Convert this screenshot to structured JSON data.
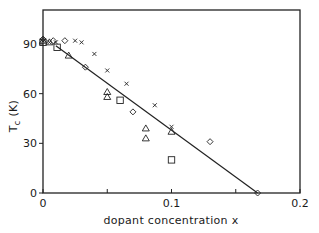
{
  "chart_data": {
    "type": "scatter",
    "title": "",
    "xlabel": "dopant concentration x",
    "ylabel": "T_c (K)",
    "ylabel_main": "T",
    "ylabel_sub": "c",
    "ylabel_unit": "(K)",
    "xlim": [
      0,
      0.2
    ],
    "ylim": [
      0,
      100
    ],
    "grid": false,
    "legend": "none",
    "x_ticks": [
      0,
      0.05,
      0.1,
      0.15,
      0.2
    ],
    "x_tick_labels": [
      "0",
      "",
      "0.1",
      "",
      "0.2"
    ],
    "y_ticks": [
      0,
      30,
      60,
      90
    ],
    "y_tick_labels": [
      "0",
      "30",
      "60",
      "90"
    ],
    "series": [
      {
        "name": "cross",
        "marker": "x",
        "points": [
          {
            "x": 0.0,
            "y": 92
          },
          {
            "x": 0.005,
            "y": 91
          },
          {
            "x": 0.01,
            "y": 91
          },
          {
            "x": 0.025,
            "y": 92
          },
          {
            "x": 0.03,
            "y": 91
          },
          {
            "x": 0.04,
            "y": 84
          },
          {
            "x": 0.05,
            "y": 74
          },
          {
            "x": 0.065,
            "y": 66
          },
          {
            "x": 0.087,
            "y": 53
          },
          {
            "x": 0.1,
            "y": 40
          }
        ]
      },
      {
        "name": "triangle",
        "marker": "triangle",
        "points": [
          {
            "x": 0.0,
            "y": 92
          },
          {
            "x": 0.005,
            "y": 91
          },
          {
            "x": 0.02,
            "y": 83
          },
          {
            "x": 0.05,
            "y": 61
          },
          {
            "x": 0.05,
            "y": 58
          },
          {
            "x": 0.08,
            "y": 39
          },
          {
            "x": 0.08,
            "y": 33
          },
          {
            "x": 0.1,
            "y": 37
          }
        ]
      },
      {
        "name": "diamond",
        "marker": "diamond",
        "points": [
          {
            "x": 0.0,
            "y": 93
          },
          {
            "x": 0.008,
            "y": 92
          },
          {
            "x": 0.017,
            "y": 92
          },
          {
            "x": 0.033,
            "y": 76
          },
          {
            "x": 0.07,
            "y": 49
          },
          {
            "x": 0.13,
            "y": 31
          },
          {
            "x": 0.167,
            "y": 0
          }
        ]
      },
      {
        "name": "square",
        "marker": "square",
        "points": [
          {
            "x": 0.0,
            "y": 91
          },
          {
            "x": 0.011,
            "y": 88
          },
          {
            "x": 0.06,
            "y": 56
          },
          {
            "x": 0.1,
            "y": 20
          }
        ]
      }
    ],
    "fit_line": {
      "x": [
        0.01,
        0.167
      ],
      "y": [
        89,
        0
      ]
    }
  }
}
